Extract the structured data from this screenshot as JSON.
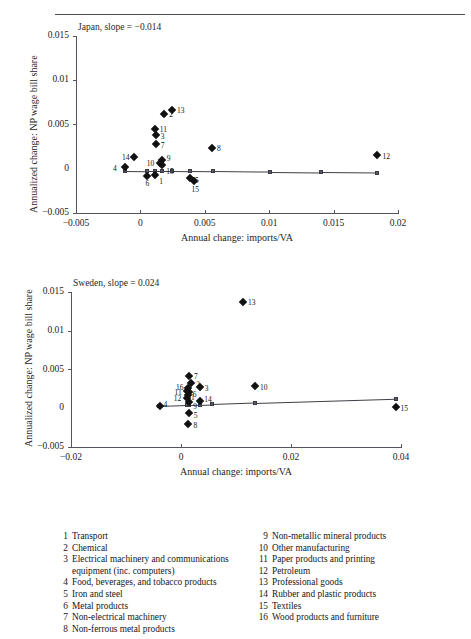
{
  "header": {
    "running_title": "",
    "folio": ""
  },
  "charts": [
    {
      "title": "Japan, slope = −0.014",
      "ylabel": "Annualized change: NP wage bill share",
      "xlabel": "Annual change: imports/VA",
      "xticks": [
        "−0.005",
        "0",
        "0.005",
        "0.01",
        "0.015",
        "0.02"
      ],
      "xtickvals": [
        -0.005,
        0,
        0.005,
        0.01,
        0.015,
        0.02
      ],
      "yticks": [
        "0.015",
        "0.01",
        "0.005",
        "0",
        "−0.005"
      ],
      "ytickvals": [
        0.015,
        0.01,
        0.005,
        0,
        -0.005
      ],
      "xlim": [
        -0.005,
        0.02
      ],
      "ylim": [
        -0.005,
        0.015
      ],
      "points": [
        {
          "id": "1",
          "x": 0.00115,
          "y": -0.0007,
          "lx": 4,
          "ly": 3
        },
        {
          "id": "2",
          "x": 0.00185,
          "y": 0.00615,
          "lx": 5,
          "ly": -3
        },
        {
          "id": "3",
          "x": 0.0012,
          "y": 0.00385,
          "lx": 5,
          "ly": -2
        },
        {
          "id": "4",
          "x": -0.0012,
          "y": 0.0002,
          "lx": -12,
          "ly": -2
        },
        {
          "id": "5",
          "x": 0.00385,
          "y": -0.00105,
          "lx": 5,
          "ly": -1
        },
        {
          "id": "6",
          "x": 0.00055,
          "y": -0.0008,
          "lx": -2,
          "ly": 4
        },
        {
          "id": "7",
          "x": 0.0012,
          "y": 0.00275,
          "lx": 5,
          "ly": -2
        },
        {
          "id": "8",
          "x": 0.00555,
          "y": 0.00235,
          "lx": 5,
          "ly": -3
        },
        {
          "id": "9",
          "x": 0.00165,
          "y": 0.001,
          "lx": 5,
          "ly": -5
        },
        {
          "id": "10",
          "x": 0.0015,
          "y": 0.00065,
          "lx": -13,
          "ly": -3
        },
        {
          "id": "11",
          "x": 0.00112,
          "y": 0.0045,
          "lx": 5,
          "ly": -3
        },
        {
          "id": "12",
          "x": 0.0184,
          "y": 0.00155,
          "lx": 5,
          "ly": -2
        },
        {
          "id": "13",
          "x": 0.00245,
          "y": 0.00665,
          "lx": 5,
          "ly": -3
        },
        {
          "id": "14",
          "x": -0.0005,
          "y": 0.0013,
          "lx": -12,
          "ly": -3
        },
        {
          "id": "15",
          "x": 0.0017,
          "y": 0.00045,
          "lx": 4,
          "ly": 3
        },
        {
          "id": "15b",
          "label": "15",
          "x": 0.0042,
          "y": -0.00135,
          "lx": -3,
          "ly": 5
        }
      ],
      "fit": {
        "x1": -0.0012,
        "y1": -0.0002,
        "x2": 0.0184,
        "y2": -0.00048,
        "nodes": [
          {
            "x": -0.0012,
            "y": -0.0002
          },
          {
            "x": 0.00048,
            "y": -0.00023
          },
          {
            "x": 0.00115,
            "y": -0.00024
          },
          {
            "x": 0.00168,
            "y": -0.00025
          },
          {
            "x": 0.00248,
            "y": -0.00026
          },
          {
            "x": 0.00385,
            "y": -0.00028
          },
          {
            "x": 0.0056,
            "y": -0.0003
          },
          {
            "x": 0.01005,
            "y": -0.00037
          },
          {
            "x": 0.014,
            "y": -0.00042
          },
          {
            "x": 0.0184,
            "y": -0.00048
          }
        ]
      }
    },
    {
      "title": "Sweden, slope = 0.024",
      "ylabel": "Annualized change: NP wage bill share",
      "xlabel": "Annual change: imports/VA",
      "xticks": [
        "−0.02",
        "0",
        "0.02",
        "0.04"
      ],
      "xtickvals": [
        -0.02,
        0,
        0.02,
        0.04
      ],
      "yticks": [
        "0.015",
        "0.01",
        "0.005",
        "0",
        "−0.005"
      ],
      "ytickvals": [
        0.015,
        0.01,
        0.005,
        0,
        -0.005
      ],
      "xlim": [
        -0.02,
        0.04
      ],
      "ylim": [
        -0.005,
        0.015
      ],
      "points": [
        {
          "id": "1",
          "x": 0.00125,
          "y": 0.00175,
          "lx": 3,
          "ly": -1
        },
        {
          "id": "2",
          "x": 0.00185,
          "y": 0.0033,
          "lx": 5,
          "ly": -2
        },
        {
          "id": "3",
          "x": 0.0034,
          "y": 0.00275,
          "lx": 5,
          "ly": -2
        },
        {
          "id": "4",
          "x": -0.0039,
          "y": 0.0003,
          "lx": 4,
          "ly": -5
        },
        {
          "id": "5",
          "x": 0.0014,
          "y": -0.0006,
          "lx": 5,
          "ly": -1
        },
        {
          "id": "6",
          "x": 0.0014,
          "y": 0.00215,
          "lx": 4,
          "ly": -1
        },
        {
          "id": "7",
          "x": 0.00145,
          "y": 0.0041,
          "lx": 5,
          "ly": -3
        },
        {
          "id": "8",
          "x": 0.00135,
          "y": -0.002,
          "lx": 5,
          "ly": -2
        },
        {
          "id": "9",
          "x": 0.0015,
          "y": 0.00085,
          "lx": 4,
          "ly": 1
        },
        {
          "id": "10",
          "x": 0.01345,
          "y": 0.0029,
          "lx": 5,
          "ly": -2
        },
        {
          "id": "11",
          "x": 0.001,
          "y": 0.00225,
          "lx": -12,
          "ly": -2
        },
        {
          "id": "12",
          "x": 0.00105,
          "y": 0.00135,
          "lx": -13,
          "ly": 0
        },
        {
          "id": "13",
          "x": 0.01125,
          "y": 0.0137,
          "lx": 5,
          "ly": -3
        },
        {
          "id": "14",
          "x": 0.0035,
          "y": 0.00095,
          "lx": 4,
          "ly": -5
        },
        {
          "id": "15",
          "x": 0.039,
          "y": 0.0001,
          "lx": 5,
          "ly": -2
        },
        {
          "id": "16",
          "x": 0.00125,
          "y": 0.00265,
          "lx": -12,
          "ly": -4
        }
      ],
      "fit": {
        "x1": -0.004,
        "y1": 0.00028,
        "x2": 0.039,
        "y2": 0.00125,
        "nodes": [
          {
            "x": -0.004,
            "y": 0.00028
          },
          {
            "x": 0.001,
            "y": 0.0004
          },
          {
            "x": 0.0015,
            "y": 0.00042
          },
          {
            "x": 0.0035,
            "y": 0.00046
          },
          {
            "x": 0.0056,
            "y": 0.00052
          },
          {
            "x": 0.01345,
            "y": 0.00071
          },
          {
            "x": 0.039,
            "y": 0.00125
          }
        ]
      }
    }
  ],
  "legend": {
    "left": [
      {
        "num": "1",
        "text": "Transport"
      },
      {
        "num": "2",
        "text": "Chemical"
      },
      {
        "num": "3",
        "text": "Electrical machinery and communications",
        "cont": "equipment (inc. computers)"
      },
      {
        "num": "4",
        "text": "Food, beverages, and tobacco products"
      },
      {
        "num": "5",
        "text": "Iron and steel"
      },
      {
        "num": "6",
        "text": "Metal products"
      },
      {
        "num": "7",
        "text": "Non-electrical machinery"
      },
      {
        "num": "8",
        "text": "Non-ferrous metal products"
      }
    ],
    "right": [
      {
        "num": "9",
        "text": "Non-metallic mineral products"
      },
      {
        "num": "10",
        "text": "Other manufacturing"
      },
      {
        "num": "11",
        "text": "Paper products and printing"
      },
      {
        "num": "12",
        "text": "Petroleum"
      },
      {
        "num": "13",
        "text": "Professional goods"
      },
      {
        "num": "14",
        "text": "Rubber and plastic products"
      },
      {
        "num": "15",
        "text": "Textiles"
      },
      {
        "num": "16",
        "text": "Wood products and furniture"
      }
    ]
  }
}
